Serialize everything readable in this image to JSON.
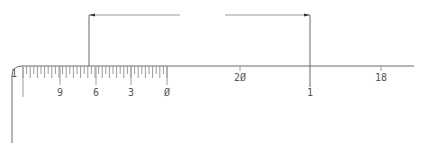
{
  "colors": {
    "background": "#ffffff",
    "line": "#6a6a6a",
    "tick": "#9a9a9a",
    "arrow": "#333333",
    "text": "#555555"
  },
  "scale": {
    "axis_y": 66,
    "axis_start_x": 22,
    "axis_end_x": 414,
    "corner": {
      "left_x": 12,
      "bottom_y": 143,
      "radius": 10
    },
    "minor_ticks": {
      "start_x": 23,
      "end_x": 167,
      "spacing": 3.6,
      "short_len": 8,
      "mid_len": 12
    },
    "major_ticks": [
      {
        "label": "1",
        "x": 23,
        "len": 31,
        "label_x": 14,
        "label_y": 77
      },
      {
        "label": "9",
        "x": 60,
        "len": 19,
        "label_x": 60,
        "label_y": 96
      },
      {
        "label": "6",
        "x": 96,
        "len": 19,
        "label_x": 96,
        "label_y": 96
      },
      {
        "label": "3",
        "x": 131,
        "len": 19,
        "label_x": 131,
        "label_y": 96
      },
      {
        "label": "Ø",
        "x": 167,
        "len": 19,
        "label_x": 167,
        "label_y": 96
      }
    ],
    "right_ticks": [
      {
        "label": "2Ø",
        "x": 240,
        "len": 5,
        "label_x": 240,
        "label_y": 81
      },
      {
        "label": "18",
        "x": 381,
        "len": 5,
        "label_x": 381,
        "label_y": 81
      }
    ]
  },
  "dimension": {
    "arrow_y": 15,
    "left_ext_x": 89,
    "right_ext_x": 310,
    "left_line_end_x": 180,
    "right_line_start_x": 225,
    "text": "",
    "right_ext_bottom_y": 87,
    "right_ext_label": "1",
    "right_ext_label_y": 96
  }
}
